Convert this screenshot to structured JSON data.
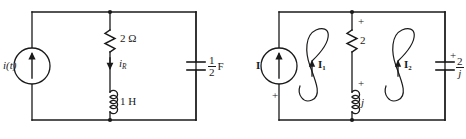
{
  "figure": {
    "type": "circuit-diagram-pair"
  },
  "left_circuit": {
    "name": "time-domain-circuit",
    "source": {
      "label": "i(t)",
      "kind": "current-source",
      "arrow_direction": "up"
    },
    "resistor": {
      "value": "2",
      "unit": "Ω",
      "label": "2 Ω"
    },
    "branch_current": {
      "symbol": "i",
      "subscript": "R",
      "arrow_direction": "down"
    },
    "inductor": {
      "value": "1",
      "unit": "H",
      "label": "1 H"
    },
    "capacitor": {
      "numerator": "1",
      "denominator": "2",
      "unit": "F"
    }
  },
  "right_circuit": {
    "name": "phasor-domain-circuit",
    "source": {
      "label": "I",
      "kind": "current-source",
      "arrow_direction": "up",
      "polarity_marker": "+"
    },
    "mesh_currents": [
      {
        "symbol": "I",
        "subscript": "1",
        "direction": "counterclockwise"
      },
      {
        "symbol": "I",
        "subscript": "2",
        "direction": "counterclockwise"
      }
    ],
    "resistor": {
      "value": "2",
      "polarity_marker": "+"
    },
    "inductor": {
      "value": "j",
      "polarity_marker": "+"
    },
    "capacitor": {
      "numerator": "2",
      "denominator": "j",
      "polarity_marker": "+"
    }
  },
  "style": {
    "stroke": "#1a1a1a",
    "background": "#ffffff"
  }
}
